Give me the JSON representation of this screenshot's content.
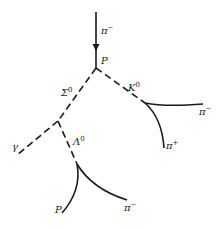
{
  "diagram": {
    "title": "",
    "colors": {
      "ink": "#1a1a1a",
      "background": "#ffffff"
    },
    "vertices": [
      {
        "id": "production",
        "x": 96,
        "y": 68
      },
      {
        "id": "sigma-decay",
        "x": 58,
        "y": 121
      },
      {
        "id": "kaon-decay",
        "x": 145,
        "y": 103
      },
      {
        "id": "lambda-decay",
        "x": 77,
        "y": 164
      }
    ],
    "labels": {
      "incoming_pion": {
        "base": "π",
        "sup": "−"
      },
      "production_proton": {
        "base": "P",
        "sup": ""
      },
      "sigma0": {
        "base": "Σ",
        "sup": "0"
      },
      "kaon0": {
        "base": "K",
        "sup": "0"
      },
      "kaon_pi_minus": {
        "base": "π",
        "sup": "−"
      },
      "kaon_pi_plus": {
        "base": "π",
        "sup": "+"
      },
      "gamma": {
        "base": "γ",
        "sup": ""
      },
      "lambda0": {
        "base": "Λ",
        "sup": "0"
      },
      "lambda_proton": {
        "base": "P",
        "sup": ""
      },
      "lambda_pi_minus": {
        "base": "π",
        "sup": "−"
      }
    },
    "tracks": [
      {
        "name": "incoming π−",
        "type": "charged",
        "from": [
          96,
          12
        ],
        "to": [
          96,
          68
        ]
      },
      {
        "name": "Σ0",
        "type": "neutral",
        "from": [
          96,
          68
        ],
        "to": [
          58,
          121
        ]
      },
      {
        "name": "K0",
        "type": "neutral",
        "from": [
          96,
          68
        ],
        "to": [
          145,
          103
        ]
      },
      {
        "name": "γ",
        "type": "neutral",
        "from": [
          58,
          121
        ],
        "to": [
          17,
          155
        ]
      },
      {
        "name": "Λ0",
        "type": "neutral",
        "from": [
          58,
          121
        ],
        "to": [
          77,
          164
        ]
      },
      {
        "name": "π− (from K0)",
        "type": "charged",
        "from": [
          145,
          103
        ],
        "to": [
          203,
          104
        ]
      },
      {
        "name": "π+ (from K0)",
        "type": "charged",
        "from": [
          145,
          103
        ],
        "to": [
          164,
          148
        ]
      },
      {
        "name": "P (from Λ0)",
        "type": "charged",
        "from": [
          77,
          164
        ],
        "to": [
          62,
          213
        ]
      },
      {
        "name": "π− (from Λ0)",
        "type": "charged",
        "from": [
          77,
          164
        ],
        "to": [
          127,
          200
        ]
      }
    ]
  }
}
